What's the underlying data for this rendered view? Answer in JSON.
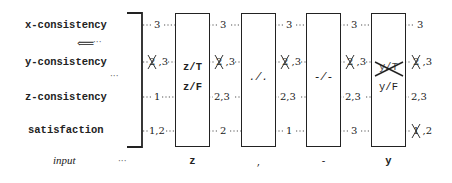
{
  "rows": [
    {
      "label": "x-consistency",
      "y": 25
    },
    {
      "label": "y-consistency",
      "y": 62
    },
    {
      "label": "z-consistency",
      "y": 97
    },
    {
      "label": "satisfaction",
      "y": 131
    }
  ],
  "arrow": {
    "glyph": "⟸",
    "trailing": "···"
  },
  "ellipsis": "···",
  "input_label": "input",
  "input_ellipsis": "···",
  "boxes": [
    {
      "x": 175,
      "lines": [
        "z/T",
        "z/F"
      ],
      "input": "z",
      "crossed_line": -1
    },
    {
      "x": 241,
      "lines": [
        "./."
      ],
      "input": ",",
      "crossed_line": -1
    },
    {
      "x": 306,
      "lines": [
        "-/-"
      ],
      "input": "-",
      "crossed_line": -1
    },
    {
      "x": 371,
      "lines": [
        "y/T",
        "y/F"
      ],
      "input": "y",
      "crossed_line": 0
    }
  ],
  "columns": [
    {
      "x": 155,
      "values": [
        {
          "text": "3",
          "struck": ""
        },
        {
          "text": ",3",
          "struck": "2"
        },
        {
          "text": "1",
          "struck": ""
        },
        {
          "text": "1,2",
          "struck": ""
        }
      ]
    },
    {
      "x": 222,
      "values": [
        {
          "text": "3",
          "struck": ""
        },
        {
          "text": ",3",
          "struck": "2"
        },
        {
          "text": "2,3",
          "struck": ""
        },
        {
          "text": "2",
          "struck": ""
        }
      ]
    },
    {
      "x": 288,
      "values": [
        {
          "text": "3",
          "struck": ""
        },
        {
          "text": ",3",
          "struck": "2"
        },
        {
          "text": "2,3",
          "struck": ""
        },
        {
          "text": "1",
          "struck": ""
        }
      ]
    },
    {
      "x": 353,
      "values": [
        {
          "text": "3",
          "struck": ""
        },
        {
          "text": ",3",
          "struck": "2"
        },
        {
          "text": "2,3",
          "struck": ""
        },
        {
          "text": "3",
          "struck": ""
        }
      ]
    },
    {
      "x": 418,
      "values": [
        {
          "text": "3",
          "struck": ""
        },
        {
          "text": ",3",
          "struck": "2"
        },
        {
          "text": "2,3",
          "struck": ""
        },
        {
          "text": ",2",
          "struck": "1"
        }
      ]
    }
  ]
}
